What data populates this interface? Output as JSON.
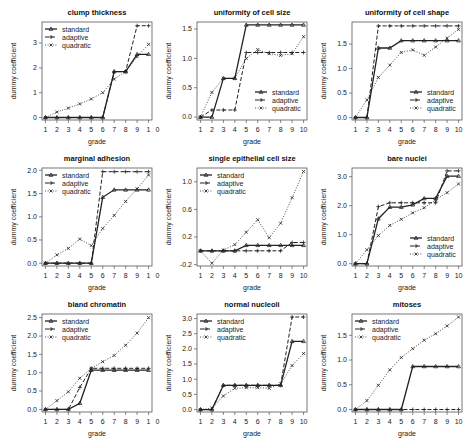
{
  "chart_data": [
    {
      "type": "line",
      "title": "clump thickness",
      "xlabel": "grade",
      "ylabel": "dummy coefficient",
      "x": [
        1,
        2,
        3,
        4,
        5,
        6,
        7,
        8,
        9,
        10
      ],
      "xtick_labels": [
        "1",
        "2",
        "3",
        "4",
        "5",
        "6",
        "7",
        "8",
        "9",
        "1",
        "0"
      ],
      "ylim": [
        -0.1,
        3.85
      ],
      "yticks": [
        0,
        1,
        2,
        3
      ],
      "ytick_labels": [
        "0",
        "1",
        "2",
        "3"
      ],
      "legend_position": "topleft",
      "series": [
        {
          "name": "standard",
          "values": [
            0,
            0,
            0,
            0,
            0,
            0,
            1.85,
            1.85,
            2.55,
            2.55
          ]
        },
        {
          "name": "adaptive",
          "values": [
            0,
            0,
            0,
            0,
            0,
            0,
            1.85,
            1.85,
            3.7,
            3.7
          ]
        },
        {
          "name": "quadratic",
          "values": [
            0,
            0.22,
            0.38,
            0.55,
            0.75,
            1.0,
            1.55,
            1.85,
            2.45,
            2.95
          ]
        }
      ]
    },
    {
      "type": "line",
      "title": "uniformity of cell size",
      "xlabel": "grade",
      "ylabel": "dummy coefficient",
      "x": [
        1,
        2,
        3,
        4,
        5,
        6,
        7,
        8,
        9,
        10
      ],
      "xtick_labels": [
        "1",
        "2",
        "3",
        "4",
        "5",
        "6",
        "7",
        "8",
        "9",
        "10"
      ],
      "ylim": [
        -0.05,
        1.62
      ],
      "yticks": [
        0,
        0.5,
        1.0,
        1.5
      ],
      "ytick_labels": [
        "0.0",
        "0.5",
        "1.0",
        "1.5"
      ],
      "legend_position": "bottomright",
      "series": [
        {
          "name": "standard",
          "values": [
            0,
            0,
            0.66,
            0.66,
            1.57,
            1.57,
            1.57,
            1.57,
            1.57,
            1.57
          ]
        },
        {
          "name": "adaptive",
          "values": [
            0,
            0.12,
            0.12,
            0.12,
            1.1,
            1.1,
            1.1,
            1.1,
            1.1,
            1.1
          ]
        },
        {
          "name": "quadratic",
          "values": [
            0,
            0.42,
            0.66,
            0.66,
            1.0,
            1.15,
            1.08,
            1.05,
            1.08,
            1.37
          ]
        }
      ]
    },
    {
      "type": "line",
      "title": "uniformity of cell shape",
      "xlabel": "grade",
      "ylabel": "dummy coefficient",
      "x": [
        1,
        2,
        3,
        4,
        5,
        6,
        7,
        8,
        9,
        10
      ],
      "xtick_labels": [
        "1",
        "2",
        "3",
        "4",
        "5",
        "6",
        "7",
        "8",
        "9",
        "10"
      ],
      "ylim": [
        -0.05,
        1.95
      ],
      "yticks": [
        0,
        0.5,
        1.0,
        1.5
      ],
      "ytick_labels": [
        "0.0",
        "0.5",
        "1.0",
        "1.5"
      ],
      "legend_position": "bottomright",
      "series": [
        {
          "name": "standard",
          "values": [
            0,
            0,
            1.42,
            1.42,
            1.57,
            1.57,
            1.57,
            1.57,
            1.57,
            1.57
          ]
        },
        {
          "name": "adaptive",
          "values": [
            0,
            0,
            1.87,
            1.87,
            1.87,
            1.87,
            1.87,
            1.87,
            1.87,
            1.87
          ]
        },
        {
          "name": "quadratic",
          "values": [
            0,
            0.36,
            0.82,
            1.07,
            1.33,
            1.38,
            1.27,
            1.44,
            1.62,
            1.8
          ]
        }
      ]
    },
    {
      "type": "line",
      "title": "marginal adhesion",
      "xlabel": "grade",
      "ylabel": "dummy coefficient",
      "x": [
        1,
        2,
        3,
        4,
        5,
        6,
        7,
        8,
        9,
        10
      ],
      "xtick_labels": [
        "1",
        "2",
        "3",
        "4",
        "5",
        "6",
        "7",
        "8",
        "9",
        "1",
        "0"
      ],
      "ylim": [
        -0.06,
        2.05
      ],
      "yticks": [
        0,
        0.5,
        1.0,
        1.5,
        2.0
      ],
      "ytick_labels": [
        "0.0",
        "0.5",
        "1.0",
        "1.5",
        "2.0"
      ],
      "legend_position": "topleft",
      "series": [
        {
          "name": "standard",
          "values": [
            0,
            0,
            0,
            0,
            0,
            1.42,
            1.58,
            1.58,
            1.58,
            1.58
          ]
        },
        {
          "name": "adaptive",
          "values": [
            0,
            0,
            0,
            0,
            0,
            1.97,
            1.97,
            1.97,
            1.97,
            1.97
          ]
        },
        {
          "name": "quadratic",
          "values": [
            0,
            0.18,
            0.32,
            0.52,
            0.38,
            0.75,
            1.03,
            1.33,
            1.6,
            1.9
          ]
        }
      ]
    },
    {
      "type": "line",
      "title": "single epithelial cell size",
      "xlabel": "grade",
      "ylabel": "dummy coefficient",
      "x": [
        1,
        2,
        3,
        4,
        5,
        6,
        7,
        8,
        9,
        10
      ],
      "xtick_labels": [
        "1",
        "2",
        "3",
        "4",
        "5",
        "6",
        "7",
        "8",
        "9",
        "10"
      ],
      "ylim": [
        -0.22,
        1.2
      ],
      "yticks": [
        -0.2,
        0.2,
        0.6,
        1.0
      ],
      "ytick_labels": [
        "-0.2",
        "0.2",
        "0.6",
        "1.0"
      ],
      "legend_position": "topleft",
      "series": [
        {
          "name": "standard",
          "values": [
            0,
            0,
            0,
            0,
            0.08,
            0.08,
            0.08,
            0.08,
            0.08,
            0.08
          ]
        },
        {
          "name": "adaptive",
          "values": [
            0,
            0,
            0,
            0,
            0,
            0,
            0,
            0,
            0.12,
            0.12
          ]
        },
        {
          "name": "quadratic",
          "values": [
            0,
            -0.18,
            0.01,
            0.09,
            0.27,
            0.45,
            0.19,
            0.4,
            0.77,
            1.15
          ]
        }
      ]
    },
    {
      "type": "line",
      "title": "bare nuclei",
      "xlabel": "grade",
      "ylabel": "dummy coefficient",
      "x": [
        1,
        2,
        3,
        4,
        5,
        6,
        7,
        8,
        9,
        10
      ],
      "xtick_labels": [
        "1",
        "2",
        "3",
        "4",
        "5",
        "6",
        "7",
        "8",
        "9",
        "10"
      ],
      "ylim": [
        -0.08,
        3.3
      ],
      "yticks": [
        0,
        1.0,
        2.0,
        3.0
      ],
      "ytick_labels": [
        "0.0",
        "1.0",
        "2.0",
        "3.0"
      ],
      "legend_position": "bottomright",
      "series": [
        {
          "name": "standard",
          "values": [
            0,
            0,
            1.55,
            1.95,
            1.95,
            2.03,
            2.25,
            2.25,
            3.02,
            3.02
          ]
        },
        {
          "name": "adaptive",
          "values": [
            0,
            0,
            1.97,
            2.1,
            2.1,
            2.1,
            2.1,
            2.1,
            3.2,
            3.2
          ]
        },
        {
          "name": "quadratic",
          "values": [
            0,
            0.48,
            0.97,
            1.32,
            1.53,
            1.75,
            1.93,
            2.2,
            2.45,
            2.75
          ]
        }
      ]
    },
    {
      "type": "line",
      "title": "bland chromatin",
      "xlabel": "grade",
      "ylabel": "dummy coefficient",
      "x": [
        1,
        2,
        3,
        4,
        5,
        6,
        7,
        8,
        9,
        10
      ],
      "xtick_labels": [
        "1",
        "2",
        "3",
        "4",
        "5",
        "6",
        "7",
        "8",
        "9",
        "1",
        "0"
      ],
      "ylim": [
        -0.07,
        2.6
      ],
      "yticks": [
        0,
        0.5,
        1.0,
        1.5,
        2.0,
        2.5
      ],
      "ytick_labels": [
        "0.0",
        "0.5",
        "1.0",
        "1.5",
        "2.0",
        "2.5"
      ],
      "legend_position": "topleft",
      "series": [
        {
          "name": "standard",
          "values": [
            0,
            0,
            0,
            0.17,
            1.07,
            1.07,
            1.07,
            1.07,
            1.07,
            1.07
          ]
        },
        {
          "name": "adaptive",
          "values": [
            0,
            0,
            0,
            0.6,
            1.12,
            1.12,
            1.12,
            1.12,
            1.12,
            1.12
          ]
        },
        {
          "name": "quadratic",
          "values": [
            0,
            0.24,
            0.48,
            0.85,
            1.12,
            1.3,
            1.47,
            1.75,
            2.08,
            2.5
          ]
        }
      ]
    },
    {
      "type": "line",
      "title": "normal nucleoli",
      "xlabel": "grade",
      "ylabel": "dummy coefficient",
      "x": [
        1,
        2,
        3,
        4,
        5,
        6,
        7,
        8,
        9,
        10
      ],
      "xtick_labels": [
        "1",
        "2",
        "3",
        "4",
        "5",
        "6",
        "7",
        "8",
        "9",
        "10"
      ],
      "ylim": [
        -0.08,
        3.15
      ],
      "yticks": [
        0,
        0.5,
        1.0,
        1.5,
        2.0,
        2.5,
        3.0
      ],
      "ytick_labels": [
        "0.0",
        "0.5",
        "1.0",
        "1.5",
        "2.0",
        "2.5",
        "3.0"
      ],
      "legend_position": "topleft",
      "series": [
        {
          "name": "standard",
          "values": [
            0,
            0,
            0.8,
            0.8,
            0.8,
            0.8,
            0.8,
            0.8,
            2.25,
            2.25
          ]
        },
        {
          "name": "adaptive",
          "values": [
            0,
            0,
            0.8,
            0.8,
            0.8,
            0.8,
            0.8,
            0.8,
            3.05,
            3.05
          ]
        },
        {
          "name": "quadratic",
          "values": [
            0,
            0.05,
            0.45,
            0.7,
            0.72,
            0.72,
            0.7,
            0.85,
            1.45,
            1.85
          ]
        }
      ]
    },
    {
      "type": "line",
      "title": "mitoses",
      "xlabel": "grade",
      "ylabel": "dummy coefficient",
      "x": [
        1,
        2,
        3,
        4,
        5,
        6,
        7,
        8,
        9,
        10
      ],
      "xtick_labels": [
        "1",
        "2",
        "3",
        "4",
        "5",
        "6",
        "7",
        "8",
        "9",
        "10"
      ],
      "ylim": [
        -0.05,
        1.93
      ],
      "yticks": [
        0,
        0.5,
        1.0,
        1.5
      ],
      "ytick_labels": [
        "0.0",
        "0.5",
        "1.0",
        "1.5"
      ],
      "legend_position": "topleft",
      "series": [
        {
          "name": "standard",
          "values": [
            0,
            0,
            0,
            0,
            0,
            0.87,
            0.87,
            0.87,
            0.87,
            0.87
          ]
        },
        {
          "name": "adaptive",
          "values": [
            0,
            0,
            0,
            0,
            0,
            0,
            0,
            0,
            0,
            0
          ]
        },
        {
          "name": "quadratic",
          "values": [
            0,
            0.18,
            0.49,
            0.8,
            1.05,
            1.23,
            1.4,
            1.53,
            1.69,
            1.87
          ]
        }
      ]
    }
  ],
  "style": {
    "line_color": "#222222",
    "axis_color": "#555555",
    "legend_labels": [
      "standard",
      "adaptive",
      "quadratic"
    ]
  }
}
